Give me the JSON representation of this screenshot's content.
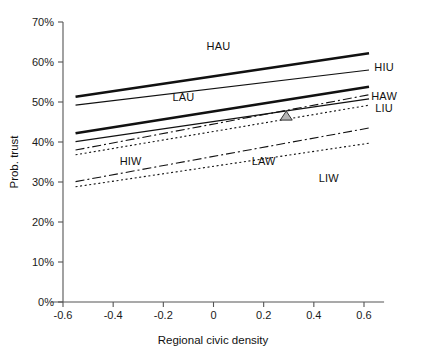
{
  "chart_data": {
    "type": "line",
    "title": "",
    "xlabel": "Regional civic density",
    "ylabel": "Prob. trust",
    "xlim": [
      -0.7,
      0.7
    ],
    "ylim": [
      0,
      70
    ],
    "grid": false,
    "legend": "inline-labels",
    "x_ticks": [
      "-0.6",
      "-0.4",
      "-0.2",
      "0",
      "0.2",
      "0.4",
      "0.6"
    ],
    "x_tick_values": [
      -0.6,
      -0.4,
      -0.2,
      0,
      0.2,
      0.4,
      0.6
    ],
    "y_ticks": [
      "0%",
      "10%",
      "20%",
      "30%",
      "40%",
      "50%",
      "60%",
      "70%"
    ],
    "y_tick_values": [
      0,
      10,
      20,
      30,
      40,
      50,
      60,
      70
    ],
    "x": [
      -0.55,
      0.62
    ],
    "series": [
      {
        "name": "HAU",
        "label": "HAU",
        "style": "solid-thick",
        "values": [
          51.3,
          62.2
        ],
        "label_x": 0.02,
        "label_y": 64.0
      },
      {
        "name": "HIU",
        "label": "HIU",
        "style": "solid-thin",
        "values": [
          49.2,
          58.0
        ],
        "label_x": 0.68,
        "label_y": 58.8
      },
      {
        "name": "LAU",
        "label": "LAU",
        "style": "solid-thick",
        "values": [
          42.2,
          53.8
        ],
        "label_x": -0.12,
        "label_y": 51.2
      },
      {
        "name": "HAW",
        "label": "HAW",
        "style": "dash-dot",
        "values": [
          38.0,
          51.8
        ],
        "label_x": 0.68,
        "label_y": 51.6
      },
      {
        "name": "LIU",
        "label": "LIU",
        "style": "solid-thin",
        "values": [
          40.1,
          50.8
        ],
        "label_x": 0.68,
        "label_y": 48.6
      },
      {
        "name": "HIW",
        "label": "HIW",
        "style": "dotted",
        "values": [
          36.8,
          49.2
        ],
        "label_x": -0.33,
        "label_y": 35.2
      },
      {
        "name": "LAW",
        "label": "LAW",
        "style": "dash-dot",
        "values": [
          30.1,
          43.5
        ],
        "label_x": 0.2,
        "label_y": 35.2
      },
      {
        "name": "LIW",
        "label": "LIW",
        "style": "dotted",
        "values": [
          28.8,
          39.7
        ],
        "label_x": 0.46,
        "label_y": 31.0
      }
    ],
    "markers": [
      {
        "name": "triangle-marker",
        "shape": "triangle",
        "x": 0.29,
        "y": 46.6
      }
    ],
    "colors": {
      "line": "#111111",
      "axis": "#555555",
      "background": "#ffffff",
      "marker_fill": "#b5b5b5",
      "marker_stroke": "#333333"
    }
  }
}
